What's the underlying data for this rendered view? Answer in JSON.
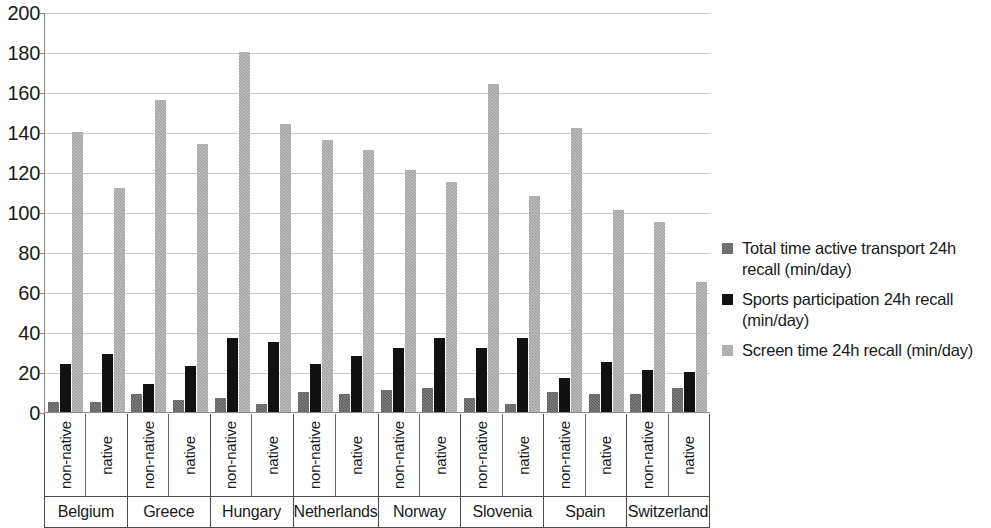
{
  "chart_data": {
    "type": "bar",
    "title": "",
    "xlabel": "",
    "ylabel": "",
    "ylim": [
      0,
      200
    ],
    "ytick_step": 20,
    "yticks": [
      200,
      180,
      160,
      140,
      120,
      100,
      80,
      60,
      40,
      20,
      0
    ],
    "grid": true,
    "legend_position": "right",
    "countries": [
      "Belgium",
      "Greece",
      "Hungary",
      "Netherlands",
      "Norway",
      "Slovenia",
      "Spain",
      "Switzerland"
    ],
    "groups": [
      "non-native",
      "native"
    ],
    "categories": [
      "Belgium non-native",
      "Belgium native",
      "Greece non-native",
      "Greece native",
      "Hungary non-native",
      "Hungary native",
      "Netherlands non-native",
      "Netherlands native",
      "Norway non-native",
      "Norway native",
      "Slovenia non-native",
      "Slovenia native",
      "Spain non-native",
      "Spain native",
      "Switzerland non-native",
      "Switzerland native"
    ],
    "series": [
      {
        "name": "Total time active transport 24h recall (min/day)",
        "color": "#565656",
        "values": [
          5,
          5,
          9,
          6,
          7,
          4,
          10,
          9,
          11,
          12,
          7,
          4,
          10,
          9,
          9,
          12
        ]
      },
      {
        "name": "Sports participation 24h recall (min/day)",
        "color": "#111111",
        "values": [
          24,
          29,
          14,
          23,
          37,
          35,
          24,
          28,
          32,
          37,
          32,
          37,
          17,
          25,
          21,
          20
        ]
      },
      {
        "name": "Screen time 24h recall (min/day)",
        "color": "#9c9c9c",
        "values": [
          140,
          112,
          156,
          134,
          180,
          144,
          136,
          131,
          121,
          115,
          164,
          108,
          142,
          101,
          95,
          65
        ]
      }
    ]
  },
  "legend": {
    "items": [
      {
        "label": "Total time active transport 24h recall (min/day)",
        "swatch_class": "sw-transport",
        "name": "legend-swatch-transport"
      },
      {
        "label": "Sports participation 24h recall (min/day)",
        "swatch_class": "sw-sports",
        "name": "legend-swatch-sports"
      },
      {
        "label": "Screen time 24h recall (min/day)",
        "swatch_class": "sw-screen",
        "name": "legend-swatch-screen"
      }
    ]
  }
}
